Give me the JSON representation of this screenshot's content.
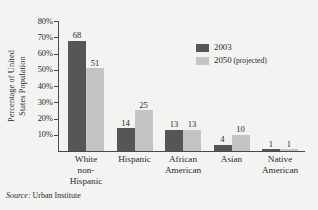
{
  "chart_data": {
    "type": "bar",
    "title": "",
    "xlabel": "",
    "ylabel_line1": "Percentage of United",
    "ylabel_line2": "States Population",
    "ylim": [
      0,
      80
    ],
    "ytick_values": [
      80,
      70,
      60,
      50,
      40,
      30,
      20,
      10
    ],
    "ytick_labels": [
      "80%",
      "70%",
      "60%",
      "50%",
      "40%",
      "30%",
      "20%",
      "10%"
    ],
    "grid": false,
    "legend_position": "upper-right",
    "categories": [
      {
        "lines": [
          "White",
          "non-",
          "Hispanic"
        ]
      },
      {
        "lines": [
          "Hispanic"
        ]
      },
      {
        "lines": [
          "African",
          "American"
        ]
      },
      {
        "lines": [
          "Asian"
        ]
      },
      {
        "lines": [
          "Native",
          "American"
        ]
      }
    ],
    "series": [
      {
        "name": "2003",
        "legend_label": "2003",
        "legend_suffix": "",
        "color": "#565656",
        "values": [
          68,
          14,
          13,
          4,
          1
        ]
      },
      {
        "name": "2050",
        "legend_label": "2050",
        "legend_suffix": "(projected)",
        "color": "#c4c4c4",
        "values": [
          51,
          25,
          13,
          10,
          1
        ]
      }
    ]
  },
  "source": {
    "label": "Source:",
    "text": "Urban Institute"
  },
  "colors": {
    "background": "#f3f3f1",
    "axis": "#4a4a4a",
    "text": "#2b2b2b",
    "series_2003": "#565656",
    "series_2050": "#c4c4c4"
  }
}
